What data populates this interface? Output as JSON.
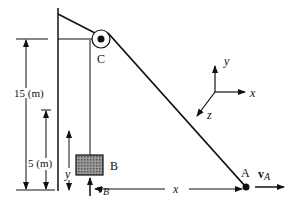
{
  "diagram": {
    "labels": {
      "pulley": "C",
      "block": "B",
      "end_point": "A",
      "height_total": "15 (m)",
      "height_block_ref": "5 (m)",
      "y_var": "y",
      "x_var": "x",
      "vB_main": "v",
      "vB_sub": "B",
      "vA_main": "v",
      "vA_sub": "A"
    },
    "axes": {
      "x": "x",
      "y": "y",
      "z": "z"
    },
    "colors": {
      "ink": "#111111",
      "block_fill": "#8a8a8a"
    }
  }
}
